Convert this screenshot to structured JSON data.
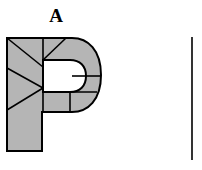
{
  "figure": {
    "panel_label": "A",
    "canvas": {
      "width": 202,
      "height": 170,
      "background": "#ffffff"
    },
    "colors": {
      "fill": "#b5b5b5",
      "outline": "#000000",
      "counter": "#ffffff",
      "background": "#ffffff"
    },
    "shape": {
      "name": "letter-P",
      "description": "Block capital letter P, filled light gray with black outline, partitioned by internal straight cut lines into sub-regions",
      "bounds": {
        "x": 6,
        "y": 37,
        "width": 95,
        "height": 115
      },
      "stem": {
        "x": 6,
        "y": 37,
        "width": 37,
        "height": 115
      },
      "bowl": {
        "x": 43,
        "y": 37,
        "right": 101,
        "bottom": 112
      },
      "counter": {
        "x": 44,
        "y": 60,
        "width": 28,
        "height": 32
      },
      "outline_path": "M 7 38 L 7 151 L 42 151 L 42 112 L 72 112 C 88 112 101 100 101 75 C 101 50 88 38 72 38 Z M 43 60 L 70 60 C 80 60 86 66 86 76 C 86 86 80 92 70 92 L 43 92 Z",
      "cut_lines": [
        {
          "name": "stem-diagonal-upper",
          "x1": 7,
          "y1": 38,
          "x2": 43,
          "y2": 67
        },
        {
          "name": "stem-diagonal-lower-left",
          "x1": 7,
          "y1": 68,
          "x2": 43,
          "y2": 88
        },
        {
          "name": "stem-diagonal-bottom",
          "x1": 43,
          "y1": 88,
          "x2": 7,
          "y2": 110
        },
        {
          "name": "bowl-top-diagonal",
          "x1": 43,
          "y1": 60,
          "x2": 66,
          "y2": 38
        },
        {
          "name": "bowl-mid-horizontal",
          "x1": 72,
          "y1": 76,
          "x2": 101,
          "y2": 76
        },
        {
          "name": "bowl-lower-horizontal",
          "x1": 43,
          "y1": 92,
          "x2": 97,
          "y2": 92
        },
        {
          "name": "bowl-lower-vertical",
          "x1": 70,
          "y1": 92,
          "x2": 70,
          "y2": 112
        }
      ]
    },
    "panel_divider": {
      "name": "panel-b-left-edge",
      "x": 192,
      "y1": 37,
      "y2": 160
    }
  }
}
